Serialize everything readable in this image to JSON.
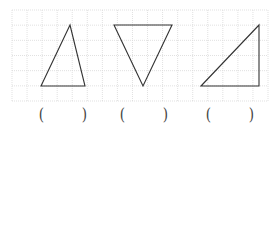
{
  "diagram": {
    "grid": {
      "x0": 12,
      "y0": 10,
      "x1": 268,
      "y1": 101,
      "cols": 17,
      "rows": 6,
      "line_color": "#d9d9d9",
      "dash": "1,1"
    },
    "stroke_color": "#333333",
    "shapes": [
      {
        "name": "acute-triangle",
        "points": "70,25 41,86 85,86"
      },
      {
        "name": "inverted-triangle",
        "points": "114,25 172,25 143,86"
      },
      {
        "name": "right-triangle",
        "points": "201,86 259,25 259,86"
      }
    ],
    "answer_blanks": [
      {
        "open": "(",
        "close": ")"
      },
      {
        "open": "(",
        "close": ")"
      },
      {
        "open": "(",
        "close": ")"
      }
    ]
  }
}
